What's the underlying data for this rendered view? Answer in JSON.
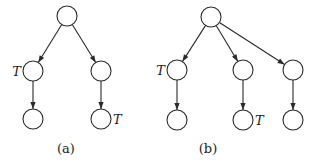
{
  "diagrams": [
    {
      "id": "a",
      "caption": "(a)",
      "node_radius": 10,
      "nodes": [
        {
          "name": "root",
          "x": 67,
          "y": 16,
          "label": ""
        },
        {
          "name": "left-child",
          "x": 33,
          "y": 71,
          "label": "T",
          "label_side": "left"
        },
        {
          "name": "right-child",
          "x": 101,
          "y": 71,
          "label": ""
        },
        {
          "name": "left-grandchild",
          "x": 33,
          "y": 119,
          "label": ""
        },
        {
          "name": "right-grandchild",
          "x": 101,
          "y": 119,
          "label": "T",
          "label_side": "right"
        }
      ],
      "edges": [
        [
          0,
          1
        ],
        [
          0,
          2
        ],
        [
          1,
          3
        ],
        [
          2,
          4
        ]
      ],
      "caption_pos": {
        "x": 66,
        "y": 153
      }
    },
    {
      "id": "b",
      "caption": "(b)",
      "node_radius": 10,
      "nodes": [
        {
          "name": "root",
          "x": 211,
          "y": 17,
          "label": ""
        },
        {
          "name": "left-child",
          "x": 177,
          "y": 70,
          "label": "T",
          "label_side": "left"
        },
        {
          "name": "middle-child",
          "x": 243,
          "y": 70,
          "label": ""
        },
        {
          "name": "right-child",
          "x": 293,
          "y": 70,
          "label": ""
        },
        {
          "name": "left-grandchild",
          "x": 177,
          "y": 120,
          "label": ""
        },
        {
          "name": "middle-grandchild",
          "x": 243,
          "y": 120,
          "label": "T",
          "label_side": "right"
        },
        {
          "name": "right-grandchild",
          "x": 293,
          "y": 120,
          "label": ""
        }
      ],
      "edges": [
        [
          0,
          1
        ],
        [
          0,
          2
        ],
        [
          0,
          3
        ],
        [
          1,
          4
        ],
        [
          2,
          5
        ],
        [
          3,
          6
        ]
      ],
      "caption_pos": {
        "x": 208,
        "y": 153
      }
    }
  ]
}
